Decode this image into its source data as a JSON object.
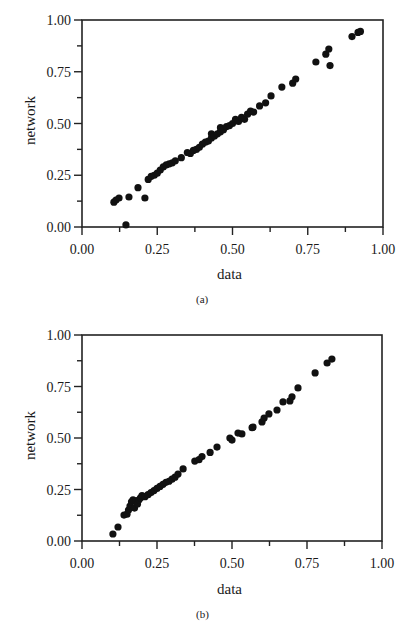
{
  "chart_data": [
    {
      "type": "scatter",
      "caption": "(a)",
      "title": "",
      "xlabel": "data",
      "ylabel": "network",
      "xlim": [
        0,
        1
      ],
      "ylim": [
        0,
        1
      ],
      "xticks": [
        "0.00",
        "0.25",
        "0.50",
        "0.75",
        "1.00"
      ],
      "yticks": [
        "0.00",
        "0.25",
        "0.50",
        "0.75",
        "1.00"
      ],
      "grid": false,
      "legend": null,
      "points": [
        [
          0.106,
          0.12
        ],
        [
          0.113,
          0.13
        ],
        [
          0.123,
          0.14
        ],
        [
          0.146,
          0.01
        ],
        [
          0.156,
          0.145
        ],
        [
          0.186,
          0.19
        ],
        [
          0.209,
          0.14
        ],
        [
          0.22,
          0.23
        ],
        [
          0.23,
          0.245
        ],
        [
          0.24,
          0.25
        ],
        [
          0.25,
          0.26
        ],
        [
          0.26,
          0.275
        ],
        [
          0.27,
          0.29
        ],
        [
          0.28,
          0.3
        ],
        [
          0.29,
          0.305
        ],
        [
          0.3,
          0.31
        ],
        [
          0.31,
          0.32
        ],
        [
          0.33,
          0.335
        ],
        [
          0.35,
          0.36
        ],
        [
          0.36,
          0.355
        ],
        [
          0.37,
          0.37
        ],
        [
          0.38,
          0.375
        ],
        [
          0.39,
          0.385
        ],
        [
          0.4,
          0.4
        ],
        [
          0.41,
          0.41
        ],
        [
          0.42,
          0.415
        ],
        [
          0.43,
          0.43
        ],
        [
          0.43,
          0.45
        ],
        [
          0.44,
          0.44
        ],
        [
          0.45,
          0.45
        ],
        [
          0.46,
          0.46
        ],
        [
          0.46,
          0.48
        ],
        [
          0.47,
          0.47
        ],
        [
          0.48,
          0.485
        ],
        [
          0.49,
          0.49
        ],
        [
          0.5,
          0.5
        ],
        [
          0.51,
          0.52
        ],
        [
          0.52,
          0.51
        ],
        [
          0.53,
          0.53
        ],
        [
          0.54,
          0.52
        ],
        [
          0.55,
          0.545
        ],
        [
          0.56,
          0.56
        ],
        [
          0.57,
          0.555
        ],
        [
          0.59,
          0.585
        ],
        [
          0.61,
          0.6
        ],
        [
          0.628,
          0.633
        ],
        [
          0.664,
          0.676
        ],
        [
          0.7,
          0.695
        ],
        [
          0.71,
          0.715
        ],
        [
          0.777,
          0.797
        ],
        [
          0.81,
          0.835
        ],
        [
          0.82,
          0.86
        ],
        [
          0.824,
          0.78
        ],
        [
          0.897,
          0.92
        ],
        [
          0.917,
          0.94
        ],
        [
          0.925,
          0.945
        ]
      ]
    },
    {
      "type": "scatter",
      "caption": "(b)",
      "title": "",
      "xlabel": "data",
      "ylabel": "network",
      "xlim": [
        0,
        1
      ],
      "ylim": [
        0,
        1
      ],
      "xticks": [
        "0.00",
        "0.25",
        "0.50",
        "0.75",
        "1.00"
      ],
      "yticks": [
        "0.00",
        "0.25",
        "0.50",
        "0.75",
        "1.00"
      ],
      "grid": false,
      "legend": null,
      "points": [
        [
          0.103,
          0.034
        ],
        [
          0.12,
          0.068
        ],
        [
          0.14,
          0.126
        ],
        [
          0.15,
          0.13
        ],
        [
          0.155,
          0.15
        ],
        [
          0.16,
          0.17
        ],
        [
          0.165,
          0.19
        ],
        [
          0.17,
          0.2
        ],
        [
          0.175,
          0.16
        ],
        [
          0.18,
          0.195
        ],
        [
          0.185,
          0.18
        ],
        [
          0.19,
          0.2
        ],
        [
          0.195,
          0.21
        ],
        [
          0.2,
          0.22
        ],
        [
          0.21,
          0.215
        ],
        [
          0.22,
          0.225
        ],
        [
          0.23,
          0.235
        ],
        [
          0.24,
          0.245
        ],
        [
          0.25,
          0.255
        ],
        [
          0.26,
          0.265
        ],
        [
          0.27,
          0.275
        ],
        [
          0.28,
          0.285
        ],
        [
          0.29,
          0.29
        ],
        [
          0.3,
          0.3
        ],
        [
          0.31,
          0.31
        ],
        [
          0.32,
          0.325
        ],
        [
          0.337,
          0.35
        ],
        [
          0.376,
          0.388
        ],
        [
          0.39,
          0.395
        ],
        [
          0.4,
          0.41
        ],
        [
          0.427,
          0.43
        ],
        [
          0.45,
          0.456
        ],
        [
          0.493,
          0.5
        ],
        [
          0.5,
          0.49
        ],
        [
          0.52,
          0.524
        ],
        [
          0.533,
          0.52
        ],
        [
          0.567,
          0.55
        ],
        [
          0.57,
          0.553
        ],
        [
          0.6,
          0.578
        ],
        [
          0.607,
          0.597
        ],
        [
          0.623,
          0.617
        ],
        [
          0.65,
          0.636
        ],
        [
          0.67,
          0.675
        ],
        [
          0.693,
          0.68
        ],
        [
          0.7,
          0.7
        ],
        [
          0.72,
          0.743
        ],
        [
          0.777,
          0.816
        ],
        [
          0.817,
          0.864
        ],
        [
          0.833,
          0.883
        ]
      ]
    }
  ]
}
